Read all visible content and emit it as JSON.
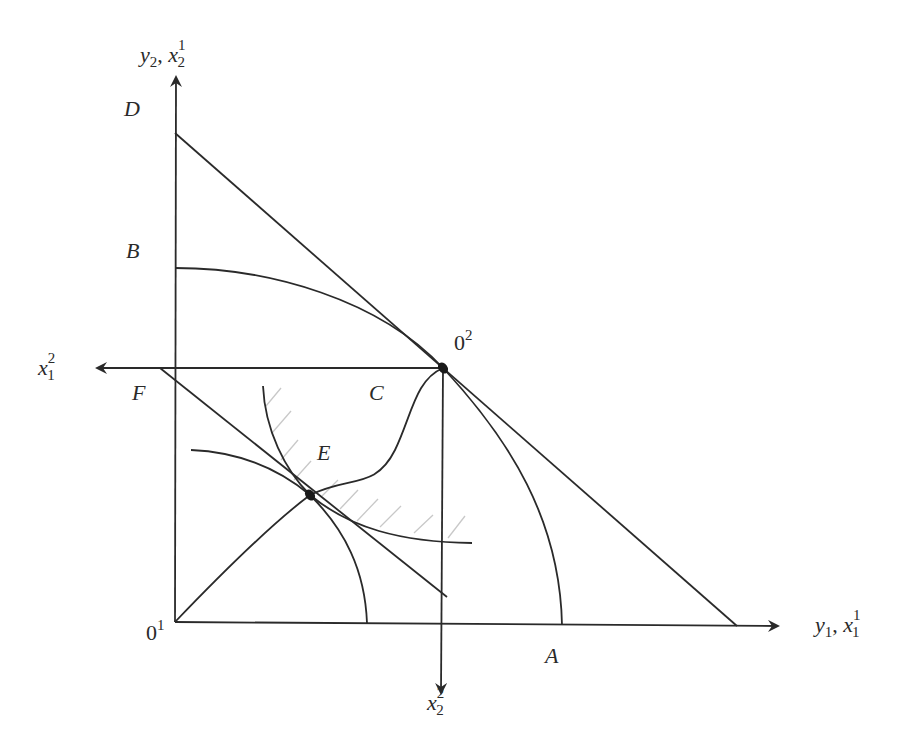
{
  "figure": {
    "type": "edgeworth-box-production-possibility-diagram",
    "axes": {
      "vertical": {
        "label_main": "y",
        "label_main_sub": "2",
        "label_sep": ", ",
        "label_second": "x",
        "label_second_sub": "2",
        "label_second_sup": "1"
      },
      "horizontal": {
        "label_main": "y",
        "label_main_sub": "1",
        "label_sep": ", ",
        "label_second": "x",
        "label_second_sub": "1",
        "label_second_sup": "1"
      },
      "left_arrow": {
        "label": "x",
        "label_sub": "1",
        "label_sup": "2"
      },
      "down_arrow": {
        "label": "x",
        "label_sub": "2",
        "label_sup": "2"
      }
    },
    "points": {
      "origin1": {
        "label": "0",
        "sup": "1"
      },
      "origin2": {
        "label": "0",
        "sup": "2"
      },
      "A": "A",
      "B": "B",
      "C": "C",
      "D": "D",
      "E": "E",
      "F": "F"
    },
    "elements": [
      "production possibility frontier B to A through 0²",
      "budget/price line D to horizontal axis tangent at 0²",
      "contract curve C from 0¹ through E to 0²",
      "price line through F tangent at E",
      "two indifference curves crossing at E",
      "hatched region between indifference curves"
    ],
    "colors": {
      "line": "#2a2a2a",
      "hatch": "#c8c8c8",
      "background": "#ffffff"
    }
  }
}
